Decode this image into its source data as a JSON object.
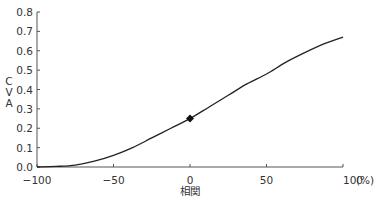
{
  "chart_data": {
    "type": "line",
    "title": "",
    "xlabel": "相関",
    "ylabel": "CVA",
    "x_unit": "(%)",
    "xlim": [
      -100,
      100
    ],
    "ylim": [
      0,
      0.8
    ],
    "x_ticks": [
      -100,
      -50,
      0,
      50,
      100
    ],
    "y_ticks": [
      "0.0",
      "0.1",
      "0.2",
      "0.3",
      "0.4",
      "0.5",
      "0.6",
      "0.7",
      "0.8"
    ],
    "grid": false,
    "legend": null,
    "series": [
      {
        "name": "CVA",
        "x": [
          -100,
          -87.5,
          -75,
          -62.5,
          -50,
          -37.5,
          -25,
          -12.5,
          0,
          12.5,
          25,
          37.5,
          50,
          62.5,
          75,
          87.5,
          100
        ],
        "values": [
          0.0,
          0.003,
          0.01,
          0.03,
          0.06,
          0.1,
          0.15,
          0.2,
          0.25,
          0.31,
          0.37,
          0.43,
          0.48,
          0.54,
          0.59,
          0.635,
          0.67
        ]
      }
    ],
    "annotations": [
      {
        "type": "marker",
        "shape": "diamond",
        "x": 0,
        "y": 0.25
      }
    ]
  }
}
